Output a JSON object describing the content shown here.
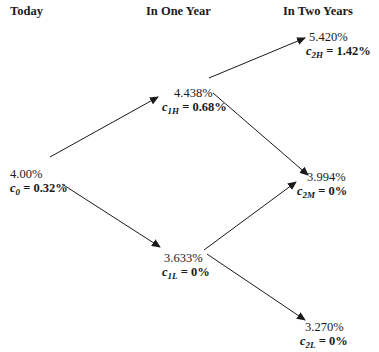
{
  "headers": {
    "today": "Today",
    "one_year": "In One Year",
    "two_years": "In Two Years"
  },
  "nodes": {
    "n0": {
      "rate": "4.00%",
      "c": "c",
      "sub": "0",
      "value": " = 0.32%"
    },
    "n1H": {
      "rate": "4.438%",
      "c": "c",
      "sub": "1H",
      "value": " = 0.68%"
    },
    "n1L": {
      "rate": "3.633%",
      "c": "c",
      "sub": "1L",
      "value": " = 0%"
    },
    "n2H": {
      "rate": "5.420%",
      "c": "c",
      "sub": "2H",
      "value": " = 1.42%"
    },
    "n2M": {
      "rate": "3.994%",
      "c": "c",
      "sub": "2M",
      "value": " = 0%"
    },
    "n2L": {
      "rate": "3.270%",
      "c": "c",
      "sub": "2L",
      "value": " = 0%"
    }
  },
  "colors": {
    "line": "#1a1a1a",
    "background": "#ffffff"
  }
}
